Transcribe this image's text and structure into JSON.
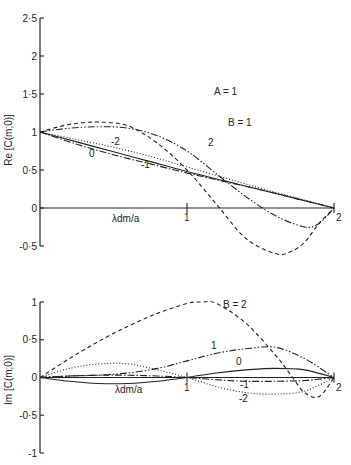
{
  "chart_data": [
    {
      "type": "line",
      "title": "",
      "annotation": "A = 1",
      "xlabel": "λdm/a",
      "ylabel": "Re [C(m;0)]",
      "xlim": [
        0,
        2
      ],
      "ylim": [
        -0.5,
        2.5
      ],
      "xticks": [
        1,
        2
      ],
      "xtick_labels": [
        "1",
        "2"
      ],
      "yticks": [
        -0.5,
        0,
        0.5,
        1,
        1.5,
        2,
        2.5
      ],
      "ytick_labels": [
        "-0·5",
        "0",
        "0·5",
        "1",
        "1·5",
        "2",
        "2·5"
      ],
      "grid": false,
      "series": [
        {
          "name": "B = 2",
          "label": "2",
          "style": "dashed",
          "x": [
            0,
            0.2,
            0.4,
            0.6,
            0.8,
            1.0,
            1.2,
            1.4,
            1.6,
            1.7,
            1.8,
            1.9,
            2.0
          ],
          "y": [
            1.0,
            1.1,
            1.13,
            1.08,
            0.85,
            0.5,
            0.05,
            -0.4,
            -0.6,
            -0.58,
            -0.45,
            -0.2,
            0.0
          ]
        },
        {
          "name": "B = 1",
          "label": "B = 1",
          "style": "dash-dot-dot",
          "x": [
            0,
            0.2,
            0.4,
            0.6,
            0.8,
            1.0,
            1.2,
            1.4,
            1.6,
            1.8,
            1.9,
            2.0
          ],
          "y": [
            1.0,
            1.05,
            1.07,
            1.05,
            0.95,
            0.75,
            0.45,
            0.15,
            -0.1,
            -0.25,
            -0.2,
            0.0
          ]
        },
        {
          "name": "B = 0",
          "label": "0",
          "style": "solid",
          "x": [
            0,
            0.25,
            0.5,
            0.75,
            1.0,
            1.25,
            1.5,
            1.75,
            2.0
          ],
          "y": [
            1.0,
            0.87,
            0.74,
            0.61,
            0.48,
            0.36,
            0.24,
            0.12,
            0.0
          ]
        },
        {
          "name": "B = -1",
          "label": "-1",
          "style": "dash-dot",
          "x": [
            0,
            0.25,
            0.5,
            0.75,
            1.0,
            1.25,
            1.5,
            1.75,
            2.0
          ],
          "y": [
            1.0,
            0.84,
            0.7,
            0.58,
            0.46,
            0.35,
            0.24,
            0.12,
            0.0
          ]
        },
        {
          "name": "B = -2",
          "label": "-2",
          "style": "dotted",
          "x": [
            0,
            0.25,
            0.5,
            0.75,
            1.0,
            1.25,
            1.5,
            1.75,
            2.0
          ],
          "y": [
            1.0,
            0.9,
            0.8,
            0.68,
            0.54,
            0.4,
            0.26,
            0.13,
            0.0
          ]
        }
      ]
    },
    {
      "type": "line",
      "title": "",
      "xlabel": "λdm/a",
      "ylabel": "Im [C(m;0)]",
      "xlim": [
        0,
        2
      ],
      "ylim": [
        -1,
        1
      ],
      "xticks": [
        1,
        2
      ],
      "xtick_labels": [
        "1",
        "2"
      ],
      "yticks": [
        -1,
        -0.5,
        0,
        0.5,
        1
      ],
      "ytick_labels": [
        "-1",
        "-0·5",
        "0",
        "0·5",
        "1"
      ],
      "grid": false,
      "series": [
        {
          "name": "B = 2",
          "label": "B = 2",
          "style": "dashed",
          "x": [
            0,
            0.2,
            0.4,
            0.6,
            0.8,
            1.0,
            1.1,
            1.2,
            1.4,
            1.6,
            1.7,
            1.8,
            1.9,
            2.0
          ],
          "y": [
            0.0,
            0.25,
            0.48,
            0.68,
            0.85,
            0.98,
            1.0,
            0.98,
            0.72,
            0.3,
            0.05,
            -0.2,
            -0.25,
            0.0
          ]
        },
        {
          "name": "B = 1",
          "label": "1",
          "style": "dash-dot-dot",
          "x": [
            0,
            0.2,
            0.4,
            0.6,
            0.8,
            1.0,
            1.2,
            1.4,
            1.6,
            1.8,
            2.0
          ],
          "y": [
            0.0,
            0.02,
            0.03,
            0.06,
            0.12,
            0.22,
            0.32,
            0.38,
            0.4,
            0.25,
            0.0
          ]
        },
        {
          "name": "B = 0",
          "label": "0",
          "style": "solid",
          "x": [
            0,
            0.2,
            0.4,
            0.6,
            0.8,
            1.0,
            1.2,
            1.4,
            1.6,
            1.8,
            2.0
          ],
          "y": [
            0.0,
            -0.05,
            -0.08,
            -0.08,
            -0.05,
            0.0,
            0.06,
            0.1,
            0.12,
            0.1,
            0.0
          ]
        },
        {
          "name": "B = -1",
          "label": "-1",
          "style": "dash-dot",
          "x": [
            0,
            0.2,
            0.4,
            0.6,
            0.8,
            1.0,
            1.2,
            1.4,
            1.6,
            1.8,
            2.0
          ],
          "y": [
            0.0,
            0.02,
            0.03,
            0.03,
            0.02,
            0.0,
            -0.03,
            -0.05,
            -0.05,
            -0.04,
            0.0
          ]
        },
        {
          "name": "B = -2",
          "label": "-2",
          "style": "dotted",
          "x": [
            0,
            0.2,
            0.4,
            0.6,
            0.8,
            1.0,
            1.2,
            1.4,
            1.6,
            1.8,
            2.0
          ],
          "y": [
            0.0,
            0.12,
            0.18,
            0.18,
            0.1,
            0.0,
            -0.12,
            -0.2,
            -0.22,
            -0.18,
            0.0
          ]
        }
      ]
    }
  ]
}
